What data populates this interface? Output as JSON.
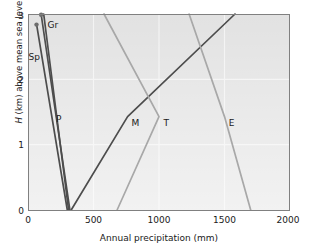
{
  "chart_data": {
    "type": "line",
    "title": "",
    "xlabel": "Annual precipitation (mm)",
    "ylabel": "H (km) above mean sea level",
    "ylabel_italic_prefix": "H",
    "ylabel_rest": " (km) above mean sea level",
    "xlim": [
      0,
      2000
    ],
    "ylim": [
      0,
      3
    ],
    "xticks": [
      0,
      500,
      1000,
      1500,
      2000
    ],
    "xtick_labels": [
      "0",
      "500",
      "1000",
      "1500",
      "2000"
    ],
    "yticks": [
      0,
      1,
      2,
      3
    ],
    "ytick_labels": [
      "0",
      "1",
      "2",
      "3"
    ],
    "grid": "light gridlines on shaded panel",
    "panel_color": "#e2e2e2",
    "grid_color": "#f4f4f4",
    "legend": "inline series labels next to curves",
    "series": [
      {
        "name": "Gr",
        "label": "Gr",
        "color": "#4d4d4d",
        "marker": "dot at upper end",
        "points": [
          [
            100,
            3.0
          ],
          [
            320,
            0
          ]
        ]
      },
      {
        "name": "Sp",
        "label": "Sp",
        "color": "#4d4d4d",
        "marker": "dot at upper end",
        "points": [
          [
            65,
            2.85
          ],
          [
            300,
            0
          ]
        ]
      },
      {
        "name": "P",
        "label": "P",
        "color": "#4d4d4d",
        "marker": "none",
        "points": [
          [
            120,
            3.0
          ],
          [
            310,
            0
          ]
        ]
      },
      {
        "name": "M",
        "label": "M",
        "color": "#4d4d4d",
        "marker": "none",
        "points": [
          [
            330,
            0
          ],
          [
            760,
            1.43
          ],
          [
            1580,
            3.0
          ]
        ]
      },
      {
        "name": "T",
        "label": "T",
        "color": "#a8a8a8",
        "marker": "none",
        "points": [
          [
            680,
            0
          ],
          [
            1000,
            1.43
          ],
          [
            580,
            3.0
          ]
        ]
      },
      {
        "name": "E",
        "label": "E",
        "color": "#a8a8a8",
        "marker": "none",
        "points": [
          [
            1700,
            0
          ],
          [
            1500,
            1.43
          ],
          [
            1230,
            3.0
          ]
        ]
      }
    ],
    "series_label_positions": [
      {
        "name": "Gr",
        "x": 190,
        "y": 2.83
      },
      {
        "name": "Sp",
        "x": 48,
        "y": 2.35
      },
      {
        "name": "P",
        "x": 235,
        "y": 1.4
      },
      {
        "name": "M",
        "x": 820,
        "y": 1.33
      },
      {
        "name": "T",
        "x": 1055,
        "y": 1.33
      },
      {
        "name": "E",
        "x": 1555,
        "y": 1.33
      }
    ]
  }
}
